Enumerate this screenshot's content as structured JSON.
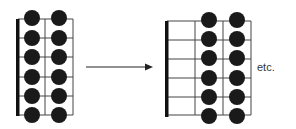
{
  "figure": {
    "left_diagram": {
      "strings": 6,
      "frets_shown": 2,
      "dot_frets": [
        1,
        2
      ],
      "dots_per_fret": 6
    },
    "arrow": {
      "direction": "right"
    },
    "right_diagram": {
      "strings": 6,
      "frets_shown": 3,
      "dot_frets": [
        2,
        3
      ],
      "dots_per_fret": 6
    },
    "etc_label": "etc.",
    "colors": {
      "line": "#333333",
      "dot": "#1a1a1a",
      "nut": "#111111"
    }
  }
}
